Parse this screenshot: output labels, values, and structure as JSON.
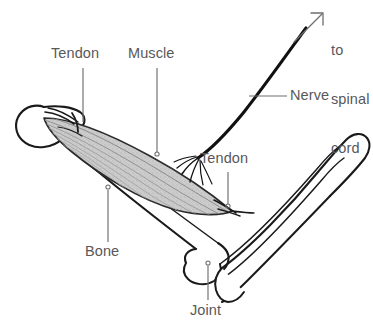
{
  "figure": {
    "background_color": "#ffffff",
    "line_color": "#1a1a1a",
    "label_color": "#58585a",
    "leader_color": "#6e6e70",
    "muscle_fill_color": "#c9c9c9",
    "muscle_fiber_color": "#8d8d8d"
  },
  "labels": {
    "tendon_upper": "Tendon",
    "muscle": "Muscle",
    "tendon_lower": "Tendon",
    "nerve": "Nerve",
    "bone": "Bone",
    "joint": "Joint",
    "to_spinal_cord_line1": "to",
    "to_spinal_cord_line2": "spinal",
    "to_spinal_cord_line3": "cord"
  },
  "icons": {
    "spinal_cord_arrow": "arrow-up-right-icon"
  },
  "parts": {
    "upper_arm_bone": "humerus-bone",
    "forearm_bones": "radius-ulna-bones",
    "muscle_belly": "biceps-muscle",
    "proximal_tendon": "proximal-tendon",
    "distal_tendon": "distal-tendon",
    "nerve_trunk": "nerve-trunk",
    "nerve_branches": "nerve-branches",
    "elbow_joint": "elbow-joint"
  }
}
